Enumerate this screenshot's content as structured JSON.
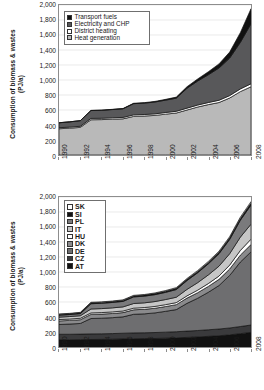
{
  "chart_data": [
    {
      "id": "top",
      "type": "area",
      "stacked": true,
      "title": "",
      "xlabel": "",
      "ylabel": "Consumption of biomass & wastes (PJ/a)",
      "ylabel_lines": [
        "Consumption of biomass & wastes",
        "(PJ/a)"
      ],
      "ylim": [
        0,
        2000
      ],
      "yticks": [
        0,
        200,
        400,
        600,
        800,
        1000,
        1200,
        1400,
        1600,
        1800,
        2000
      ],
      "ytick_labels": [
        "0",
        "200",
        "400",
        "600",
        "800",
        "1,000",
        "1,200",
        "1,400",
        "1,600",
        "1,800",
        "2,000"
      ],
      "grid": true,
      "legend_position": "upper-left",
      "x": [
        1990,
        1991,
        1992,
        1993,
        1994,
        1995,
        1996,
        1997,
        1998,
        1999,
        2000,
        2001,
        2002,
        2003,
        2004,
        2005,
        2006,
        2007,
        2008
      ],
      "xtick_labels": [
        "1990",
        "1992",
        "1994",
        "1996",
        "1998",
        "2000",
        "2002",
        "2004",
        "2006",
        "2008"
      ],
      "series": [
        {
          "name": "Heat generation",
          "color": "#b9b9b9",
          "values": [
            350,
            358,
            368,
            470,
            472,
            478,
            482,
            515,
            520,
            528,
            545,
            560,
            600,
            640,
            672,
            700,
            760,
            845,
            910
          ]
        },
        {
          "name": "District heating",
          "color": "#ffffff",
          "values": [
            14,
            14,
            15,
            18,
            18,
            18,
            19,
            20,
            20,
            21,
            22,
            23,
            25,
            26,
            28,
            30,
            32,
            36,
            40
          ]
        },
        {
          "name": "Electricity and CHP",
          "color": "#58585a",
          "values": [
            66,
            70,
            75,
            105,
            106,
            110,
            115,
            150,
            152,
            158,
            165,
            175,
            265,
            320,
            370,
            430,
            500,
            620,
            800
          ]
        },
        {
          "name": "Transport fuels",
          "color": "#111111",
          "values": [
            0,
            0,
            0,
            2,
            2,
            3,
            4,
            5,
            6,
            8,
            10,
            14,
            20,
            28,
            40,
            55,
            80,
            130,
            200
          ]
        }
      ]
    },
    {
      "id": "bottom",
      "type": "area",
      "stacked": true,
      "title": "",
      "xlabel": "",
      "ylabel": "Consumption of biomass & wastes (PJ/a)",
      "ylabel_lines": [
        "Consumption of biomass & wastes",
        "(PJ/a)"
      ],
      "ylim": [
        0,
        2000
      ],
      "yticks": [
        0,
        200,
        400,
        600,
        800,
        1000,
        1200,
        1400,
        1600,
        1800,
        2000
      ],
      "ytick_labels": [
        "0",
        "200",
        "400",
        "600",
        "800",
        "1,000",
        "1,200",
        "1,400",
        "1,600",
        "1,800",
        "2,000"
      ],
      "grid": true,
      "legend_position": "upper-left",
      "x": [
        1990,
        1991,
        1992,
        1993,
        1994,
        1995,
        1996,
        1997,
        1998,
        1999,
        2000,
        2001,
        2002,
        2003,
        2004,
        2005,
        2006,
        2007,
        2008
      ],
      "xtick_labels": [
        "1990",
        "1992",
        "1994",
        "1996",
        "1998",
        "2000",
        "2002",
        "2004",
        "2006",
        "2008"
      ],
      "series": [
        {
          "name": "AT",
          "color": "#111111",
          "values": [
            95,
            96,
            98,
            100,
            102,
            104,
            108,
            110,
            112,
            114,
            118,
            122,
            128,
            134,
            142,
            150,
            162,
            178,
            195
          ]
        },
        {
          "name": "CZ",
          "color": "#3a3a3c",
          "values": [
            75,
            74,
            74,
            75,
            74,
            75,
            76,
            78,
            78,
            79,
            80,
            82,
            84,
            86,
            88,
            90,
            92,
            95,
            98
          ]
        },
        {
          "name": "DE",
          "color": "#6e6e70",
          "values": [
            130,
            136,
            142,
            205,
            208,
            212,
            218,
            248,
            252,
            262,
            278,
            295,
            370,
            430,
            500,
            580,
            700,
            860,
            975
          ]
        },
        {
          "name": "DK",
          "color": "#8a8a8c",
          "values": [
            48,
            49,
            50,
            55,
            55,
            56,
            57,
            60,
            61,
            62,
            64,
            66,
            70,
            74,
            78,
            82,
            86,
            92,
            98
          ]
        },
        {
          "name": "HU",
          "color": "#ffffff",
          "values": [
            18,
            18,
            19,
            20,
            20,
            21,
            21,
            22,
            23,
            24,
            25,
            27,
            30,
            34,
            38,
            44,
            52,
            62,
            72
          ]
        },
        {
          "name": "IT",
          "color": "#c6c6c6",
          "values": [
            32,
            33,
            34,
            52,
            53,
            54,
            55,
            62,
            63,
            65,
            68,
            72,
            86,
            100,
            115,
            132,
            152,
            178,
            200
          ]
        },
        {
          "name": "PL",
          "color": "#7a7a7c",
          "values": [
            26,
            27,
            28,
            70,
            71,
            72,
            73,
            88,
            89,
            92,
            96,
            102,
            118,
            132,
            148,
            166,
            190,
            225,
            255
          ]
        },
        {
          "name": "SI",
          "color": "#111111",
          "values": [
            10,
            10,
            11,
            12,
            12,
            12,
            13,
            13,
            14,
            14,
            15,
            16,
            17,
            18,
            19,
            20,
            22,
            24,
            26
          ]
        },
        {
          "name": "SK",
          "color": "#ffffff",
          "values": [
            6,
            6,
            6,
            7,
            7,
            7,
            8,
            8,
            8,
            9,
            9,
            10,
            11,
            12,
            13,
            14,
            15,
            17,
            19
          ]
        }
      ]
    }
  ],
  "top_chart": {
    "ylabel_lines": [
      "Consumption of biomass & wastes",
      "(PJ/a)"
    ],
    "legend": {
      "items": [
        {
          "label": "Transport fuels",
          "color": "#111111"
        },
        {
          "label": "Electricity and CHP",
          "color": "#58585a"
        },
        {
          "label": "District heating",
          "color": "#ffffff"
        },
        {
          "label": "Heat generation",
          "color": "#b9b9b9"
        }
      ]
    }
  },
  "bottom_chart": {
    "ylabel_lines": [
      "Consumption of biomass & wastes",
      "(PJ/a)"
    ],
    "legend": {
      "items": [
        {
          "label": "SK",
          "color": "#ffffff"
        },
        {
          "label": "SI",
          "color": "#111111"
        },
        {
          "label": "PL",
          "color": "#7a7a7c"
        },
        {
          "label": "IT",
          "color": "#c6c6c6"
        },
        {
          "label": "HU",
          "color": "#ffffff"
        },
        {
          "label": "DK",
          "color": "#8a8a8c"
        },
        {
          "label": "DE",
          "color": "#6e6e70"
        },
        {
          "label": "CZ",
          "color": "#3a3a3c"
        },
        {
          "label": "AT",
          "color": "#111111"
        }
      ]
    }
  }
}
